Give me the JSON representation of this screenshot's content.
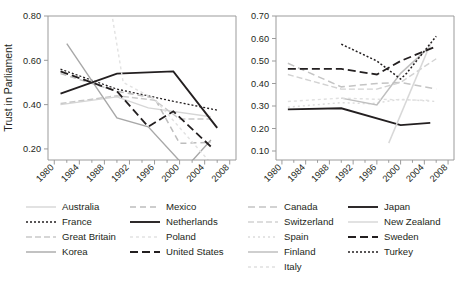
{
  "chart_data": [
    {
      "id": "left-panel",
      "type": "line",
      "title": "",
      "xlabel": "",
      "ylabel": "Trust in Parliament",
      "xlim": [
        1979,
        2009
      ],
      "ylim": [
        0.15,
        0.8
      ],
      "yticks": [
        "0.80",
        "0.60",
        "0.40",
        "0.20"
      ],
      "ytick_values": [
        0.8,
        0.6,
        0.4,
        0.2
      ],
      "xticks": [
        "1980",
        "1984",
        "1988",
        "1992",
        "1996",
        "2000",
        "2004",
        "2008"
      ],
      "xtick_values": [
        1980,
        1984,
        1988,
        1992,
        1996,
        2000,
        2004,
        2008
      ],
      "grid": false,
      "legend_position": "below",
      "series": [
        {
          "name": "Australia",
          "color": "#d6d6d6",
          "dash": "solid",
          "width": 1.4,
          "x": [
            1981,
            1990,
            1995,
            2005
          ],
          "y": [
            0.4,
            0.435,
            0.385,
            0.345
          ]
        },
        {
          "name": "France",
          "color": "#231f20",
          "dash": "2,2",
          "width": 1.3,
          "x": [
            1981,
            1990,
            1999,
            2006
          ],
          "y": [
            0.56,
            0.47,
            0.415,
            0.375
          ]
        },
        {
          "name": "Great Britain",
          "color": "#c9c9c9",
          "dash": "6,3",
          "width": 1.4,
          "x": [
            1981,
            1990,
            1996,
            2000,
            2005
          ],
          "y": [
            0.405,
            0.44,
            0.42,
            0.335,
            0.335
          ]
        },
        {
          "name": "Korea",
          "color": "#a8a8a8",
          "dash": "solid",
          "width": 1.4,
          "x": [
            1982,
            1990,
            1995,
            2001,
            2005
          ],
          "y": [
            0.675,
            0.34,
            0.3,
            0.115,
            0.24
          ]
        },
        {
          "name": "Mexico",
          "color": "#bdbdbd",
          "dash": "6,4",
          "width": 1.5,
          "x": [
            1981,
            1990,
            1996,
            2000,
            2005
          ],
          "y": [
            0.54,
            0.46,
            0.43,
            0.225,
            0.23
          ]
        },
        {
          "name": "Netherlands",
          "color": "#231f20",
          "dash": "solid",
          "width": 1.9,
          "x": [
            1981,
            1990,
            1999,
            2006
          ],
          "y": [
            0.45,
            0.54,
            0.55,
            0.295
          ]
        },
        {
          "name": "Poland",
          "color": "#e2e2e2",
          "dash": "3,3",
          "width": 1.4,
          "x": [
            1989,
            1991,
            1996,
            2005
          ],
          "y": [
            0.84,
            0.5,
            0.425,
            0.135
          ]
        },
        {
          "name": "United States",
          "color": "#231f20",
          "dash": "8,4",
          "width": 1.8,
          "x": [
            1981,
            1990,
            1995,
            1999,
            2005
          ],
          "y": [
            0.55,
            0.46,
            0.3,
            0.37,
            0.21
          ]
        }
      ]
    },
    {
      "id": "right-panel",
      "type": "line",
      "title": "",
      "xlabel": "",
      "ylabel": "",
      "xlim": [
        1979,
        2009
      ],
      "ylim": [
        0.06,
        0.7
      ],
      "yticks": [
        "0.70",
        "0.60",
        "0.50",
        "0.40",
        "0.30",
        "0.20",
        "0.10"
      ],
      "ytick_values": [
        0.7,
        0.6,
        0.5,
        0.4,
        0.3,
        0.2,
        0.1
      ],
      "xticks": [
        "1980",
        "1984",
        "1988",
        "1992",
        "1996",
        "2000",
        "2004",
        "2008"
      ],
      "xtick_values": [
        1980,
        1984,
        1988,
        1992,
        1996,
        2000,
        2004,
        2008
      ],
      "grid": false,
      "legend_position": "below",
      "series": [
        {
          "name": "Canada",
          "color": "#c4c4c4",
          "dash": "7,4",
          "width": 1.5,
          "x": [
            1981,
            1990,
            1996,
            2000,
            2006
          ],
          "y": [
            0.49,
            0.385,
            0.4,
            0.405,
            0.375
          ]
        },
        {
          "name": "Switzerland",
          "color": "#d2d2d2",
          "dash": "6,3",
          "width": 1.4,
          "x": [
            1981,
            1990,
            1996,
            2000,
            2006
          ],
          "y": [
            0.44,
            0.375,
            0.375,
            0.405,
            0.51
          ]
        },
        {
          "name": "Spain",
          "color": "#dcdcdc",
          "dash": "2,3",
          "width": 1.4,
          "x": [
            1981,
            1990,
            1995,
            2000,
            2006
          ],
          "y": [
            0.295,
            0.315,
            0.31,
            0.33,
            0.32
          ]
        },
        {
          "name": "Finland",
          "color": "#bfbfbf",
          "dash": "solid",
          "width": 1.5,
          "x": [
            1990,
            1996,
            2000,
            2005
          ],
          "y": [
            0.335,
            0.305,
            0.445,
            0.565
          ]
        },
        {
          "name": "Italy",
          "color": "#e0e0e0",
          "dash": "3,3",
          "width": 1.4,
          "x": [
            1981,
            1990,
            1996,
            2005
          ],
          "y": [
            0.32,
            0.335,
            0.33,
            0.325
          ]
        },
        {
          "name": "Japan",
          "color": "#231f20",
          "dash": "solid",
          "width": 1.9,
          "x": [
            1981,
            1990,
            2000,
            2005
          ],
          "y": [
            0.285,
            0.29,
            0.215,
            0.225
          ]
        },
        {
          "name": "New Zealand",
          "color": "#d8d8d8",
          "dash": "solid",
          "width": 1.5,
          "x": [
            1998,
            2005
          ],
          "y": [
            0.135,
            0.575
          ]
        },
        {
          "name": "Sweden",
          "color": "#231f20",
          "dash": "8,4",
          "width": 1.8,
          "x": [
            1981,
            1990,
            1996,
            2000,
            2006
          ],
          "y": [
            0.465,
            0.465,
            0.44,
            0.5,
            0.565
          ]
        },
        {
          "name": "Turkey",
          "color": "#231f20",
          "dash": "2,2",
          "width": 1.5,
          "x": [
            1990,
            1996,
            2000,
            2001,
            2006
          ],
          "y": [
            0.575,
            0.5,
            0.42,
            0.445,
            0.61
          ]
        }
      ]
    }
  ],
  "left_legend": {
    "column1": [
      {
        "label": "Australia",
        "color": "#d6d6d6",
        "dash": "solid",
        "width": 1.4
      },
      {
        "label": "France",
        "color": "#231f20",
        "dash": "2,2",
        "width": 1.3
      },
      {
        "label": "Great Britain",
        "color": "#c9c9c9",
        "dash": "6,3",
        "width": 1.4
      },
      {
        "label": "Korea",
        "color": "#a8a8a8",
        "dash": "solid",
        "width": 1.4
      }
    ],
    "column2": [
      {
        "label": "Mexico",
        "color": "#bdbdbd",
        "dash": "6,4",
        "width": 1.5
      },
      {
        "label": "Netherlands",
        "color": "#231f20",
        "dash": "solid",
        "width": 1.9
      },
      {
        "label": "Poland",
        "color": "#e2e2e2",
        "dash": "3,3",
        "width": 1.4
      },
      {
        "label": "United States",
        "color": "#231f20",
        "dash": "8,4",
        "width": 1.8
      }
    ]
  },
  "right_legend": {
    "column1": [
      {
        "label": "Canada",
        "color": "#c4c4c4",
        "dash": "7,4",
        "width": 1.5
      },
      {
        "label": "Switzerland",
        "color": "#d2d2d2",
        "dash": "6,3",
        "width": 1.4
      },
      {
        "label": "Spain",
        "color": "#dcdcdc",
        "dash": "2,3",
        "width": 1.4
      },
      {
        "label": "Finland",
        "color": "#bfbfbf",
        "dash": "solid",
        "width": 1.5
      },
      {
        "label": "Italy",
        "color": "#e0e0e0",
        "dash": "3,3",
        "width": 1.4
      }
    ],
    "column2": [
      {
        "label": "Japan",
        "color": "#231f20",
        "dash": "solid",
        "width": 1.9
      },
      {
        "label": "New Zealand",
        "color": "#d8d8d8",
        "dash": "solid",
        "width": 1.5
      },
      {
        "label": "Sweden",
        "color": "#231f20",
        "dash": "8,4",
        "width": 1.8
      },
      {
        "label": "Turkey",
        "color": "#231f20",
        "dash": "2,2",
        "width": 1.5
      }
    ]
  },
  "colors": {
    "axis": "#9b9b9b",
    "text": "#231f20",
    "background": "#ffffff"
  }
}
